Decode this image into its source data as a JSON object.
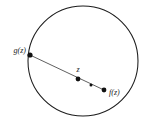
{
  "figure": {
    "type": "geometric-diagram",
    "title": "",
    "background_color": "#ffffff",
    "stroke_color": "#1c1c1c",
    "point_color": "#111111",
    "canvas": {
      "width": 147,
      "height": 126
    },
    "circle": {
      "name": "unit-circle",
      "center_x": 83,
      "center_y": 61,
      "radius": 55,
      "stroke_width": 1.05,
      "filled": false
    },
    "chord": {
      "name": "geodesic-segment",
      "x1": 30,
      "y1": 55,
      "x2": 104,
      "y2": 90,
      "stroke_width": 0.75
    },
    "points": [
      {
        "id": "g-of-z",
        "label": "g(z)",
        "x": 30,
        "y": 55,
        "radius": 2.6,
        "label_x": 26,
        "label_y": 53,
        "label_anchor": "end",
        "on_boundary": true
      },
      {
        "id": "z",
        "label": "z",
        "x": 78,
        "y": 79,
        "radius": 2.4,
        "label_x": 78,
        "label_y": 72,
        "label_anchor": "middle",
        "on_boundary": false
      },
      {
        "id": "midpoint",
        "label": "",
        "x": 91,
        "y": 85,
        "radius": 1.5,
        "label_x": 91,
        "label_y": 81,
        "label_anchor": "middle",
        "on_boundary": false
      },
      {
        "id": "f-of-z",
        "label": "f(z)",
        "x": 104,
        "y": 90,
        "radius": 2.4,
        "label_x": 109,
        "label_y": 95,
        "label_anchor": "start",
        "on_boundary": false
      }
    ]
  }
}
